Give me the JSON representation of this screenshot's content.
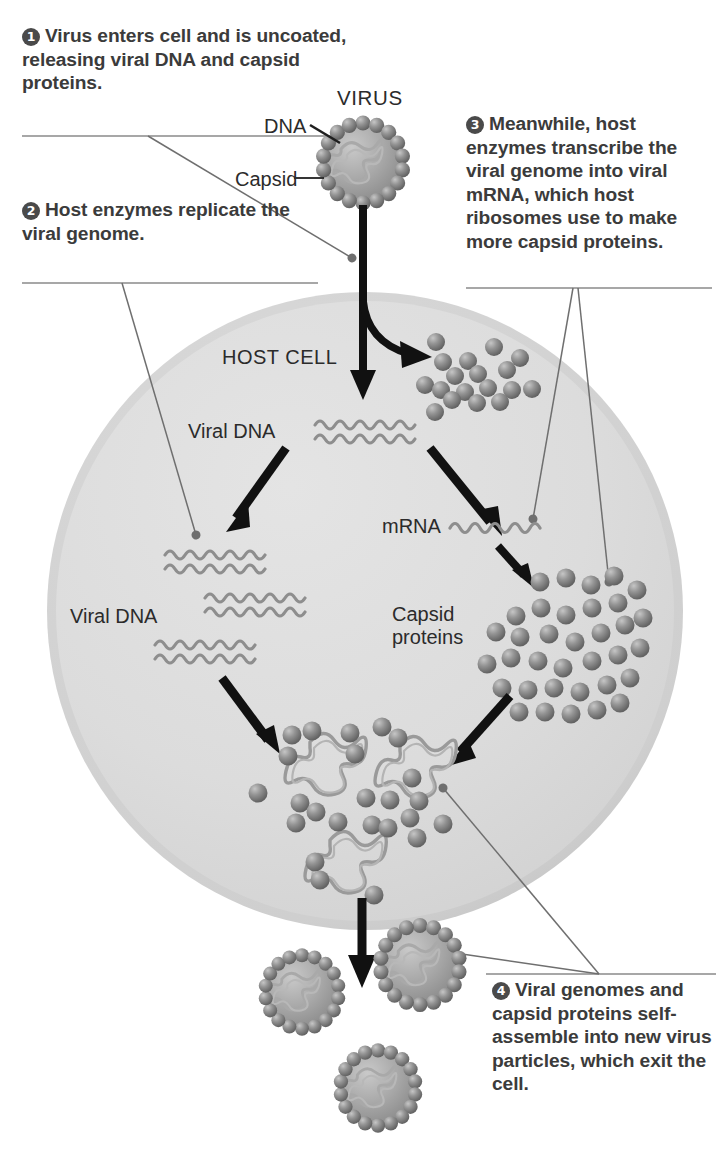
{
  "diagram": {
    "type": "biology-process-diagram",
    "colors": {
      "cell_fill": "#dcdcdc",
      "cell_rim": "#c9c9c9",
      "capsid_protein": "#808080",
      "nucleic_acid": "#8a8a8a",
      "arrow": "#111111",
      "leader_line": "#6b6b6b",
      "text": "#3b3b3b",
      "badge_fill": "#4a4a4a",
      "badge_text": "#ffffff"
    }
  },
  "callouts": [
    {
      "number": "1",
      "text": "Virus enters cell and is uncoated, releasing viral DNA and capsid proteins."
    },
    {
      "number": "2",
      "text": "Host enzymes replicate the viral genome."
    },
    {
      "number": "3",
      "text": "Meanwhile, host enzymes transcribe the viral genome into viral mRNA, which host ribosomes use to make more capsid proteins."
    },
    {
      "number": "4",
      "text": "Viral genomes and capsid proteins self-assemble into new virus particles, which exit the cell."
    }
  ],
  "labels": {
    "virus": "VIRUS",
    "dna": "DNA",
    "capsid": "Capsid",
    "host_cell": "HOST CELL",
    "viral_dna_top": "Viral DNA",
    "viral_dna_bottom": "Viral DNA",
    "mrna": "mRNA",
    "capsid_proteins": "Capsid proteins"
  }
}
